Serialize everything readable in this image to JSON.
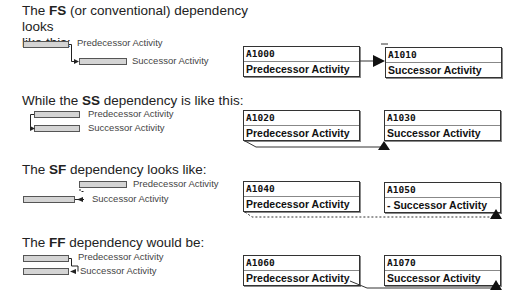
{
  "sections": [
    {
      "type": "FS",
      "heading_pre": "The ",
      "heading_bold": "FS",
      "heading_post": " (or conventional) dependency looks",
      "heading_line2": "like this:",
      "bar_labels": {
        "predecessor": "Predecessor Activity",
        "successor": "Successor Activity"
      },
      "boxes": [
        {
          "id": "A1000",
          "name": "Predecessor Activity"
        },
        {
          "id": "A1010",
          "name": "Successor Activity"
        }
      ]
    },
    {
      "type": "SS",
      "heading_pre": "While the ",
      "heading_bold": "SS",
      "heading_post": " dependency is like this:",
      "bar_labels": {
        "predecessor": "Predecessor Activity",
        "successor": "Successor Activity"
      },
      "boxes": [
        {
          "id": "A1020",
          "name": "Predecessor Activity"
        },
        {
          "id": "A1030",
          "name": "Successor Activity"
        }
      ]
    },
    {
      "type": "SF",
      "heading_pre": "The ",
      "heading_bold": "SF",
      "heading_post": " dependency looks like:",
      "bar_labels": {
        "predecessor": "Predecessor Activity",
        "successor": "Successor Activity"
      },
      "boxes": [
        {
          "id": "A1040",
          "name": "Predecessor Activity"
        },
        {
          "id": "A1050",
          "name": "- Successor Activity"
        }
      ]
    },
    {
      "type": "FF",
      "heading_pre": "The ",
      "heading_bold": "FF",
      "heading_post": " dependency would be:",
      "bar_labels": {
        "predecessor": "Predecessor Activity",
        "successor": "Successor Activity"
      },
      "boxes": [
        {
          "id": "A1060",
          "name": "Predecessor Activity"
        },
        {
          "id": "A1070",
          "name": "Successor Activity"
        }
      ]
    }
  ]
}
